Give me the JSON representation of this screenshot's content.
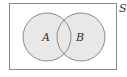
{
  "diagram": {
    "type": "venn",
    "universe": {
      "label": "S",
      "rect": {
        "x": 9.5,
        "y": 3.5,
        "width": 107,
        "height": 66
      },
      "stroke": "#8a8a8a",
      "fill": "#ffffff"
    },
    "sets": [
      {
        "label": "A",
        "cx": 47,
        "cy": 37,
        "r": 24,
        "fill": "#e8e8e8",
        "stroke": "#8a8a8a"
      },
      {
        "label": "B",
        "cx": 81,
        "cy": 37,
        "r": 24,
        "fill": "#e8e8e8",
        "stroke": "#8a8a8a"
      }
    ]
  }
}
